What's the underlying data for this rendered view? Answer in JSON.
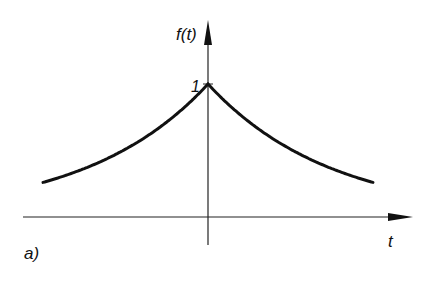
{
  "figure": {
    "panel_label": "a)",
    "y_axis_label": "f(t)",
    "x_axis_label": "t",
    "peak_label": "1"
  },
  "chart_data": {
    "type": "line",
    "title": "",
    "xlabel": "t",
    "ylabel": "f(t)",
    "function": "f(t) = exp(-a|t|)",
    "x": [
      -1,
      -0.75,
      -0.5,
      -0.25,
      0,
      0.25,
      0.5,
      0.75,
      1
    ],
    "values": [
      0.26,
      0.36,
      0.51,
      0.71,
      1.0,
      0.71,
      0.51,
      0.36,
      0.26
    ],
    "annotations": [
      "1"
    ],
    "grid": false
  }
}
